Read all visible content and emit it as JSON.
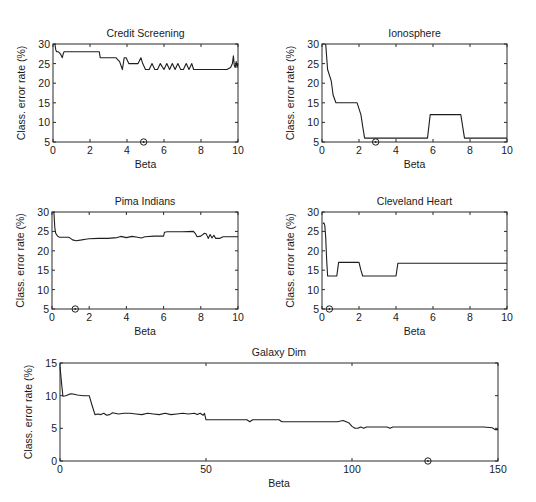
{
  "chart_data": [
    {
      "id": "credit",
      "type": "line",
      "title": "Credit Screening",
      "xlabel": "Beta",
      "ylabel": "Class. error rate (%)",
      "xlim": [
        0,
        10
      ],
      "ylim": [
        5,
        30
      ],
      "xticks": [
        0,
        2,
        4,
        6,
        8,
        10
      ],
      "yticks": [
        5,
        10,
        15,
        20,
        25,
        30
      ],
      "grid": false,
      "box": {
        "x0": 53,
        "x1": 238,
        "y0": 44,
        "y1": 142
      },
      "marker": {
        "x": 4.9,
        "y": 5
      },
      "x": [
        0.1,
        0.15,
        0.2,
        0.3,
        0.4,
        0.5,
        0.55,
        0.6,
        1.0,
        2.0,
        2.5,
        2.55,
        3.0,
        3.4,
        3.6,
        3.75,
        3.85,
        3.95,
        4.1,
        4.2,
        4.6,
        4.75,
        4.85,
        5.0,
        5.2,
        5.35,
        5.5,
        5.65,
        5.8,
        6.0,
        6.15,
        6.3,
        6.45,
        6.6,
        6.75,
        6.9,
        7.05,
        7.2,
        7.35,
        7.5,
        7.6,
        7.7,
        8.5,
        9.4,
        9.6,
        9.7,
        9.75,
        9.8,
        9.85,
        9.9,
        9.95,
        10.0
      ],
      "y": [
        30,
        28.5,
        28,
        28,
        27.5,
        26.5,
        27.5,
        28,
        28,
        28,
        28,
        26.5,
        26.5,
        26.5,
        25.5,
        23.5,
        26.5,
        26.5,
        25,
        25,
        25,
        26.5,
        25,
        23.5,
        23.5,
        25,
        23.5,
        23.5,
        25,
        23.5,
        25,
        23.5,
        25,
        23.5,
        25,
        23.5,
        23.5,
        25,
        23.5,
        25,
        23.5,
        23.5,
        23.5,
        23.5,
        24,
        25,
        27,
        24.5,
        24,
        25.5,
        24,
        25
      ]
    },
    {
      "id": "ionosphere",
      "type": "line",
      "title": "Ionosphere",
      "xlabel": "Beta",
      "ylabel": "Class. error rate (%)",
      "xlim": [
        0,
        10
      ],
      "ylim": [
        5,
        30
      ],
      "xticks": [
        0,
        2,
        4,
        6,
        8,
        10
      ],
      "yticks": [
        5,
        10,
        15,
        20,
        25,
        30
      ],
      "grid": false,
      "box": {
        "x0": 322,
        "x1": 507,
        "y0": 44,
        "y1": 142
      },
      "marker": {
        "x": 2.9,
        "y": 5
      },
      "x": [
        0.2,
        0.3,
        0.5,
        0.6,
        0.75,
        1.0,
        1.5,
        1.9,
        2.1,
        2.2,
        2.3,
        2.5,
        3.0,
        4.0,
        5.0,
        5.7,
        5.85,
        6.0,
        7.0,
        7.5,
        7.7,
        8.0,
        9.0,
        10.0
      ],
      "y": [
        30,
        23.5,
        20.5,
        17,
        15,
        15,
        15,
        15,
        12,
        9,
        6,
        6,
        6,
        6,
        6,
        6,
        12,
        12,
        12,
        12,
        6,
        6,
        6,
        6
      ]
    },
    {
      "id": "pima",
      "type": "line",
      "title": "Pima Indians",
      "xlabel": "Beta",
      "ylabel": "Class. error rate (%)",
      "xlim": [
        0,
        10
      ],
      "ylim": [
        5,
        30
      ],
      "xticks": [
        0,
        2,
        4,
        6,
        8,
        10
      ],
      "yticks": [
        5,
        10,
        15,
        20,
        25,
        30
      ],
      "grid": false,
      "box": {
        "x0": 52,
        "x1": 238,
        "y0": 212,
        "y1": 309
      },
      "marker": {
        "x": 1.25,
        "y": 5
      },
      "x": [
        0.1,
        0.15,
        0.2,
        0.3,
        0.4,
        0.6,
        0.9,
        1.0,
        1.1,
        1.3,
        1.6,
        1.8,
        2.0,
        2.5,
        3.0,
        3.5,
        3.7,
        4.0,
        4.3,
        4.6,
        4.8,
        5.0,
        5.5,
        6.0,
        6.05,
        6.2,
        7.0,
        7.6,
        7.7,
        7.8,
        8.0,
        8.2,
        8.3,
        8.4,
        8.5,
        8.6,
        8.7,
        8.8,
        9.0,
        9.2,
        10.0
      ],
      "y": [
        30,
        26,
        24.5,
        23.8,
        23.5,
        23.5,
        23.5,
        23.2,
        22.8,
        22.6,
        22.8,
        23.0,
        23.1,
        23.2,
        23.2,
        23.4,
        23.7,
        23.4,
        23.7,
        23.5,
        23.3,
        23.6,
        23.8,
        23.8,
        24.8,
        24.9,
        24.9,
        25,
        24.5,
        23.6,
        23.8,
        24.5,
        24.3,
        23.2,
        24.2,
        23.3,
        24.0,
        23.2,
        23.2,
        23.6,
        23.6
      ]
    },
    {
      "id": "cleveland",
      "type": "line",
      "title": "Cleveland Heart",
      "xlabel": "Beta",
      "ylabel": "Class. error rate (%)",
      "xlim": [
        0,
        10
      ],
      "ylim": [
        5,
        30
      ],
      "xticks": [
        0,
        2,
        4,
        6,
        8,
        10
      ],
      "yticks": [
        5,
        10,
        15,
        20,
        25,
        30
      ],
      "grid": false,
      "box": {
        "x0": 322,
        "x1": 507,
        "y0": 212,
        "y1": 309
      },
      "marker": {
        "x": 0.4,
        "y": 5
      },
      "x": [
        0.05,
        0.1,
        0.15,
        0.2,
        0.25,
        0.3,
        0.5,
        0.8,
        0.9,
        1.0,
        1.5,
        2.0,
        2.1,
        2.2,
        3.0,
        3.5,
        4.0,
        4.1,
        5.0,
        6.0,
        8.0,
        10.0
      ],
      "y": [
        27,
        27.2,
        26.5,
        23.5,
        18,
        13.5,
        13.5,
        13.5,
        17,
        17,
        17,
        17,
        15,
        13.5,
        13.5,
        13.5,
        13.5,
        16.8,
        16.8,
        16.8,
        16.8,
        16.8
      ]
    },
    {
      "id": "galaxy",
      "type": "line",
      "title": "Galaxy Dim",
      "xlabel": "Beta",
      "ylabel": "Class. error rate (%)",
      "xlim": [
        0,
        150
      ],
      "ylim": [
        0,
        15
      ],
      "xticks": [
        0,
        50,
        100,
        150
      ],
      "yticks": [
        0,
        5,
        10,
        15
      ],
      "grid": false,
      "box": {
        "x0": 60,
        "x1": 498,
        "y0": 363,
        "y1": 461
      },
      "marker": {
        "x": 126,
        "y": 0
      },
      "x": [
        0,
        0.5,
        1,
        2,
        3,
        4,
        6,
        8,
        9,
        10,
        11,
        12,
        13,
        14,
        15,
        16,
        17,
        18,
        20,
        22,
        24,
        26,
        28,
        30,
        32,
        34,
        36,
        38,
        40,
        42,
        44,
        46,
        47,
        48,
        49,
        49.5,
        50,
        52,
        55,
        60,
        64,
        65,
        66,
        68,
        72,
        75,
        76,
        80,
        85,
        90,
        95,
        97,
        98,
        99,
        100,
        101,
        102,
        103,
        104,
        105,
        106,
        108,
        112,
        113,
        114,
        116,
        120,
        130,
        140,
        145,
        148,
        149,
        150
      ],
      "y": [
        14.5,
        12,
        9.9,
        10.0,
        10.2,
        10.3,
        10.1,
        10.0,
        10.0,
        10.0,
        8.5,
        7.1,
        7.2,
        7.1,
        7.3,
        7.0,
        7.1,
        7.4,
        7.2,
        7.3,
        7.3,
        7.2,
        7.1,
        7.3,
        7.2,
        7.1,
        7.3,
        7.1,
        7.2,
        7.3,
        7.2,
        7.3,
        7.1,
        7.3,
        7.0,
        7.3,
        6.3,
        6.3,
        6.3,
        6.3,
        6.3,
        6.0,
        6.3,
        6.3,
        6.3,
        6.3,
        6.0,
        6.0,
        6.0,
        6.0,
        6.0,
        6.2,
        6.0,
        5.8,
        5.3,
        5.0,
        5.0,
        5.2,
        5.0,
        5.2,
        5.2,
        5.2,
        5.2,
        5.0,
        5.2,
        5.2,
        5.2,
        5.2,
        5.2,
        5.2,
        5.1,
        4.8,
        4.8
      ]
    }
  ]
}
